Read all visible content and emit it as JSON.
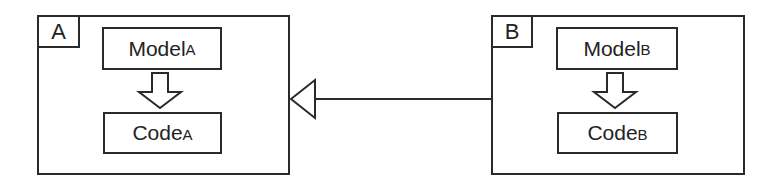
{
  "diagram": {
    "type": "package-dependency",
    "packages": [
      {
        "id": "A",
        "tab_label": "A",
        "elements": [
          {
            "name": "Model",
            "suffix": "A"
          },
          {
            "name": "Code",
            "suffix": "A"
          }
        ],
        "inner_arrow": "Model to Code (block arrow)"
      },
      {
        "id": "B",
        "tab_label": "B",
        "elements": [
          {
            "name": "Model",
            "suffix": "B"
          },
          {
            "name": "Code",
            "suffix": "B"
          }
        ],
        "inner_arrow": "Model to Code (block arrow)"
      }
    ],
    "relations": [
      {
        "from": "B",
        "to": "A",
        "kind": "generalization",
        "arrowhead": "hollow-triangle"
      }
    ],
    "colors": {
      "stroke": "#2a2a2a",
      "background": "#ffffff",
      "text": "#222222"
    }
  }
}
